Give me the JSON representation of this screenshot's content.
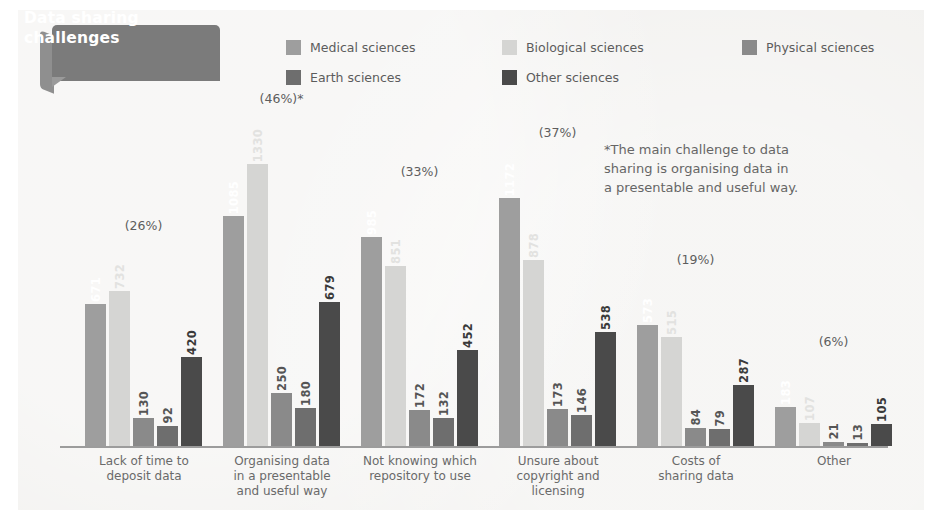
{
  "title": "Data sharing\nchallenges",
  "annotation": "*The main challenge to data\n sharing is organising data in\n a presentable and useful way.",
  "colors": {
    "medical": "#9e9e9e",
    "biological": "#d5d5d3",
    "physical": "#8a8a8a",
    "earth": "#6e6e6e",
    "other": "#4a4a4a",
    "axis": "#9c9c9c",
    "panel": "#f2f1ef",
    "ribbon": "#7b7b7b",
    "text": "#5c5c5c"
  },
  "legend": [
    {
      "label": "Medical sciences",
      "key": "medical"
    },
    {
      "label": "Biological sciences",
      "key": "biological"
    },
    {
      "label": "Physical sciences",
      "key": "physical"
    },
    {
      "label": "Earth sciences",
      "key": "earth"
    },
    {
      "label": "Other sciences",
      "key": "other"
    }
  ],
  "chart_data": {
    "type": "bar",
    "title": "Data sharing challenges",
    "xlabel": "",
    "ylabel": "Number of responses",
    "ylim": [
      0,
      1330
    ],
    "grid": false,
    "legend_position": "top",
    "categories": [
      "Lack of time to\ndeposit data",
      "Organising data\nin a presentable\nand useful way",
      "Not knowing which\nrepository to use",
      "Unsure about\ncopyright and\nlicensing",
      "Costs of\nsharing data",
      "Other"
    ],
    "series": [
      {
        "name": "Medical sciences",
        "values": [
          671,
          1085,
          985,
          1172,
          573,
          183
        ]
      },
      {
        "name": "Biological sciences",
        "values": [
          732,
          1330,
          851,
          878,
          515,
          107
        ]
      },
      {
        "name": "Physical sciences",
        "values": [
          130,
          250,
          172,
          173,
          84,
          21
        ]
      },
      {
        "name": "Earth sciences",
        "values": [
          92,
          180,
          132,
          146,
          79,
          13
        ]
      },
      {
        "name": "Other sciences",
        "values": [
          420,
          679,
          452,
          538,
          287,
          105
        ]
      }
    ],
    "group_percentages": [
      "(26%)",
      "(46%)*",
      "(33%)",
      "(37%)",
      "(19%)",
      "(6%)"
    ],
    "annotations": [
      "*The main challenge to data sharing is organising data in a presentable and useful way."
    ]
  }
}
